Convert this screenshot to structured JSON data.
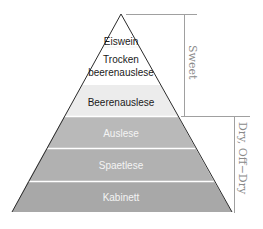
{
  "diagram": {
    "type": "pyramid",
    "title": "",
    "levels": [
      {
        "label": "Eiswein",
        "color": "#ffffff",
        "text_color": "#1a1a1a"
      },
      {
        "label_line1": "Trocken",
        "label_line2": "beerenauslese",
        "color": "#ffffff",
        "text_color": "#1a1a1a"
      },
      {
        "label": "Beerenauslese",
        "color": "#ececec",
        "text_color": "#1a1a1a"
      },
      {
        "label": "Auslese",
        "color": "#b9b9b9",
        "text_color": "#f4f4f4"
      },
      {
        "label": "Spaetlese",
        "color": "#b1b1b1",
        "text_color": "#f4f4f4"
      },
      {
        "label": "Kabinett",
        "color": "#a8a8a8",
        "text_color": "#f4f4f4"
      }
    ],
    "brackets": [
      {
        "label": "Sweet",
        "covers": [
          "Eiswein",
          "Trocken beerenauslese",
          "Beerenauslese"
        ]
      },
      {
        "label": "Dry, Off−Dry",
        "covers": [
          "Auslese",
          "Spaetlese",
          "Kabinett"
        ]
      }
    ],
    "line_color": "#a0a0a0",
    "outline_color": "#2a2a2a"
  }
}
